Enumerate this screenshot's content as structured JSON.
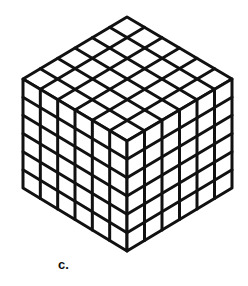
{
  "figure": {
    "caption_label": "c.",
    "grid_divisions": 6,
    "stroke_color": "#111111",
    "fill_color": "#ffffff",
    "stroke_width": 3,
    "vertices": {
      "top": [
        127,
        17
      ],
      "left_upper": [
        23,
        79
      ],
      "right_upper": [
        232,
        79
      ],
      "front_top": [
        127,
        141
      ],
      "left_lower": [
        23,
        188
      ],
      "right_lower": [
        232,
        188
      ],
      "bottom": [
        127,
        251
      ]
    }
  }
}
